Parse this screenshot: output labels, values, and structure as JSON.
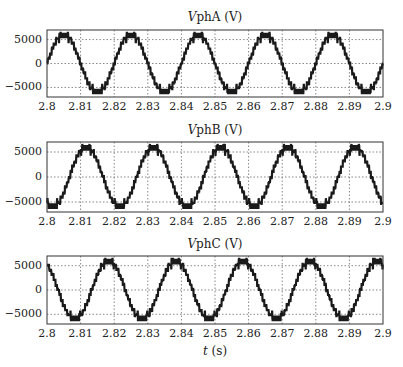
{
  "chart_data": [
    {
      "type": "line",
      "title_var": "V",
      "title_rest": "phA (V)",
      "title": "VphA (V)",
      "xlabel": "",
      "ylabel": "",
      "xlim": [
        2.8,
        2.9
      ],
      "ylim": [
        -7000,
        7000
      ],
      "xticks": [
        "2.8",
        "2.81",
        "2.82",
        "2.83",
        "2.84",
        "2.85",
        "2.86",
        "2.87",
        "2.88",
        "2.89",
        "2.9"
      ],
      "yticks": [
        "5000",
        "0",
        "-5000"
      ],
      "grid": true,
      "waveform": {
        "shape": "multilevel-staircase-sine",
        "amplitude": 6200,
        "frequency_hz": 50,
        "phase_deg": 0,
        "levels_per_half_cycle": 6
      },
      "series": [
        {
          "name": "VphA",
          "description": "7-level stepped sinusoid, ~50 Hz, peak ≈ ±6000 V, zero crossing rising at t=2.80 s"
        }
      ]
    },
    {
      "type": "line",
      "title_var": "V",
      "title_rest": "phB (V)",
      "title": "VphB (V)",
      "xlabel": "",
      "ylabel": "",
      "xlim": [
        2.8,
        2.9
      ],
      "ylim": [
        -7000,
        7000
      ],
      "xticks": [
        "2.8",
        "2.81",
        "2.82",
        "2.83",
        "2.84",
        "2.85",
        "2.86",
        "2.87",
        "2.88",
        "2.89",
        "2.9"
      ],
      "yticks": [
        "5000",
        "0",
        "-5000"
      ],
      "grid": true,
      "waveform": {
        "shape": "multilevel-staircase-sine",
        "amplitude": 6200,
        "frequency_hz": 50,
        "phase_deg": -120,
        "levels_per_half_cycle": 6
      },
      "series": [
        {
          "name": "VphB",
          "description": "7-level stepped sinusoid, ~50 Hz, peak ≈ ±6000 V, lags phase A by 120°"
        }
      ]
    },
    {
      "type": "line",
      "title_var": "V",
      "title_rest": "phC (V)",
      "title": "VphC (V)",
      "xlabel": "t (s)",
      "xlabel_var": "t",
      "xlabel_rest": " (s)",
      "ylabel": "",
      "xlim": [
        2.8,
        2.9
      ],
      "ylim": [
        -7000,
        7000
      ],
      "xticks": [
        "2.8",
        "2.81",
        "2.82",
        "2.83",
        "2.84",
        "2.85",
        "2.86",
        "2.87",
        "2.88",
        "2.89",
        "2.9"
      ],
      "yticks": [
        "5000",
        "0",
        "-5000"
      ],
      "grid": true,
      "waveform": {
        "shape": "multilevel-staircase-sine",
        "amplitude": 6200,
        "frequency_hz": 50,
        "phase_deg": 120,
        "levels_per_half_cycle": 6
      },
      "series": [
        {
          "name": "VphC",
          "description": "7-level stepped sinusoid, ~50 Hz, peak ≈ ±6000 V, leads phase A by 120°"
        }
      ]
    }
  ],
  "colors": {
    "trace": "#1a1a1a",
    "grid": "#555555",
    "axis": "#333333"
  }
}
